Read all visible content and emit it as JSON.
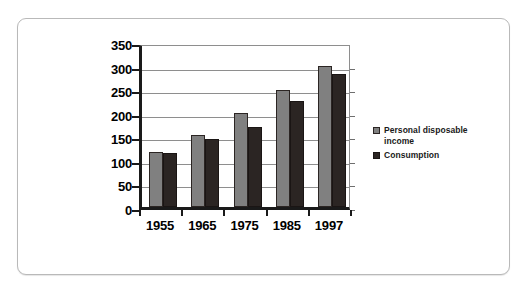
{
  "chart_data": {
    "type": "bar",
    "title": "",
    "subtitle": "",
    "xlabel": "",
    "ylabel": "",
    "categories": [
      "1955",
      "1965",
      "1975",
      "1985",
      "1997"
    ],
    "series": [
      {
        "name": "Personal disposable income",
        "color": "#808080",
        "values": [
          117,
          153,
          200,
          248,
          300
        ]
      },
      {
        "name": "Consumption",
        "color": "#2b2523",
        "values": [
          114,
          144,
          170,
          224,
          283
        ]
      }
    ],
    "yticks": [
      0,
      50,
      100,
      150,
      200,
      250,
      300,
      350
    ],
    "ylim": [
      0,
      350
    ],
    "grid": true,
    "legend_position": "right",
    "legend_entries": [
      {
        "label": "Personal disposable income",
        "color": "#808080"
      },
      {
        "label": "Consumption",
        "color": "#2b2523"
      }
    ]
  },
  "colors": {
    "series_1": "#808080",
    "series_2": "#2b2523",
    "axis": "#1a1a1a",
    "grid": "#8e8e8e",
    "card_border": "#b9b9b9",
    "background": "#ffffff"
  }
}
